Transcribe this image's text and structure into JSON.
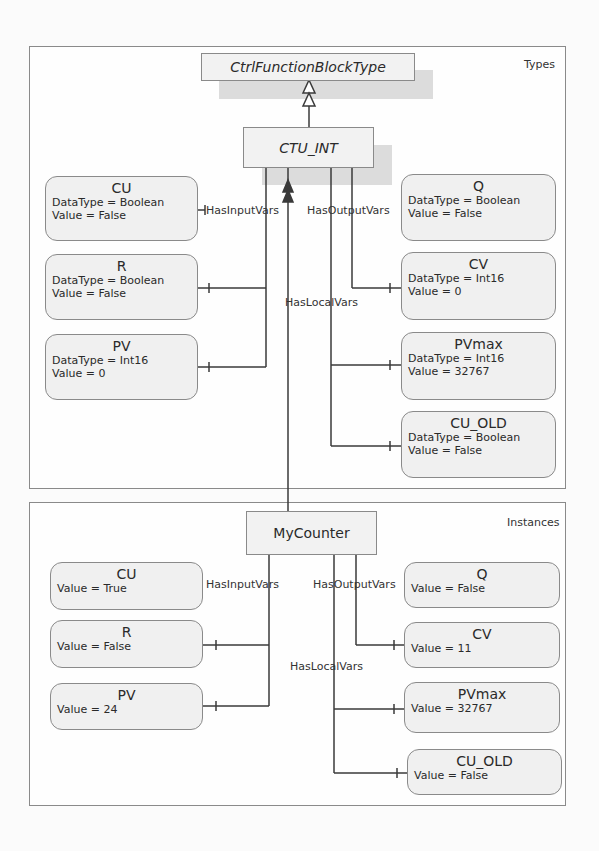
{
  "types_panel": {
    "label": "Types",
    "supertype": "CtrlFunctionBlockType",
    "type_name": "CTU_INT",
    "refs": {
      "inputs": "HasInputVars",
      "outputs": "HasOutputVars",
      "locals": "HasLocalVars"
    },
    "inputs": [
      {
        "name": "CU",
        "datatype": "DataType = Boolean",
        "value": "Value = False"
      },
      {
        "name": "R",
        "datatype": "DataType = Boolean",
        "value": "Value = False"
      },
      {
        "name": "PV",
        "datatype": "DataType = Int16",
        "value": "Value = 0"
      }
    ],
    "outputs": [
      {
        "name": "Q",
        "datatype": "DataType = Boolean",
        "value": "Value = False"
      },
      {
        "name": "CV",
        "datatype": "DataType = Int16",
        "value": "Value = 0"
      }
    ],
    "locals": [
      {
        "name": "PVmax",
        "datatype": "DataType = Int16",
        "value": "Value = 32767"
      },
      {
        "name": "CU_OLD",
        "datatype": "DataType = Boolean",
        "value": "Value = False"
      }
    ]
  },
  "instances_panel": {
    "label": "Instances",
    "instance_name": "MyCounter",
    "refs": {
      "inputs": "HasInputVars",
      "outputs": "HasOutputVars",
      "locals": "HasLocalVars"
    },
    "inputs": [
      {
        "name": "CU",
        "value": "Value = True"
      },
      {
        "name": "R",
        "value": "Value = False"
      },
      {
        "name": "PV",
        "value": "Value = 24"
      }
    ],
    "outputs": [
      {
        "name": "Q",
        "value": "Value = False"
      },
      {
        "name": "CV",
        "value": "Value = 11"
      }
    ],
    "locals": [
      {
        "name": "PVmax",
        "value": "Value = 32767"
      },
      {
        "name": "CU_OLD",
        "value": "Value = False"
      }
    ]
  },
  "colors": {
    "box_fill": "#f0f0f0",
    "line": "#3a3a3a",
    "shadow": "#dcdcdc"
  }
}
